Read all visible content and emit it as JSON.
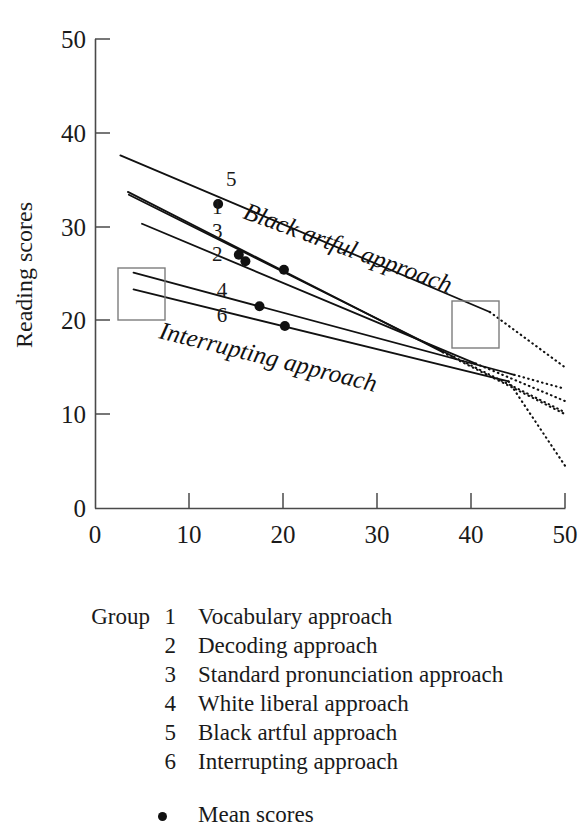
{
  "chart_data": {
    "type": "line",
    "title": "",
    "xlabel": "Black dialect scores",
    "ylabel": "Reading scores",
    "xlim": [
      0,
      50
    ],
    "ylim": [
      0,
      50
    ],
    "xticks": [
      0,
      10,
      20,
      30,
      40,
      50
    ],
    "yticks": [
      0,
      10,
      20,
      30,
      40,
      50
    ],
    "grid": false,
    "legend_position": "below-figure",
    "annotations": [
      {
        "name": "black-artful-approach-inline",
        "text": "Black artful approach",
        "rotation": 20
      },
      {
        "name": "interrupting-approach-inline",
        "text": "Interrupting approach",
        "rotation": 14
      }
    ],
    "series": [
      {
        "name": "Group 1 Vocabulary approach",
        "label": "1",
        "label_x": 13.0,
        "label_y": 31.3,
        "solid": {
          "x1": 3.5,
          "y1": 33.7,
          "x2": 37.0,
          "y2": 16.6
        },
        "dotted": {
          "x1": 37.0,
          "y1": 16.6,
          "x2": 50.0,
          "y2": 10.0
        },
        "mean_point": {
          "x": 15.3,
          "y": 27.0
        }
      },
      {
        "name": "Group 2 Decoding approach",
        "label": "2",
        "label_x": 13.0,
        "label_y": 26.3,
        "solid": {
          "x1": 5.0,
          "y1": 30.3,
          "x2": 40.5,
          "y2": 15.4
        },
        "dotted": {
          "x1": 40.5,
          "y1": 15.4,
          "x2": 50.0,
          "y2": 11.4
        },
        "mean_point": {
          "x": 20.1,
          "y": 25.4
        }
      },
      {
        "name": "Group 3 Standard pronunciation approach",
        "label": "3",
        "label_x": 13.0,
        "label_y": 28.8,
        "solid": {
          "x1": 3.6,
          "y1": 33.4,
          "x2": 38.2,
          "y2": 16.1
        },
        "dotted": {
          "x1": 38.2,
          "y1": 16.1,
          "x2": 50.0,
          "y2": 10.2
        },
        "mean_point": {
          "x": 16.0,
          "y": 26.3
        }
      },
      {
        "name": "Group 4 White liberal approach",
        "label": "4",
        "label_x": 13.5,
        "label_y": 22.5,
        "solid": {
          "x1": 4.1,
          "y1": 25.1,
          "x2": 44.6,
          "y2": 14.2
        },
        "dotted": {
          "x1": 44.6,
          "y1": 14.2,
          "x2": 50.0,
          "y2": 12.7
        },
        "mean_point": {
          "x": 17.5,
          "y": 21.5
        }
      },
      {
        "name": "Group 5 Black artful approach",
        "label": "5",
        "label_x": 14.5,
        "label_y": 34.3,
        "solid": {
          "x1": 2.7,
          "y1": 37.6,
          "x2": 42.0,
          "y2": 20.9
        },
        "dotted": {
          "x1": 42.0,
          "y1": 20.9,
          "x2": 50.0,
          "y2": 15.0
        },
        "mean_point": {
          "x": 13.1,
          "y": 32.4
        }
      },
      {
        "name": "Group 6 Interrupting approach",
        "label": "6",
        "label_x": 13.5,
        "label_y": 19.8,
        "solid": {
          "x1": 4.1,
          "y1": 23.3,
          "x2": 44.0,
          "y2": 13.5
        },
        "dotted": {
          "x1": 44.0,
          "y1": 13.5,
          "x2": 50.0,
          "y2": 4.5
        },
        "mean_point": {
          "x": 20.2,
          "y": 19.4
        }
      }
    ]
  },
  "axes": {
    "y_title": "Reading scores",
    "x_title": "Black dialect scores",
    "x_tick_labels": [
      "0",
      "10",
      "20",
      "30",
      "40",
      "50"
    ],
    "y_tick_labels": [
      "0",
      "10",
      "20",
      "30",
      "40",
      "50"
    ]
  },
  "inline_labels": {
    "black_artful": "Black artful approach",
    "interrupting": "Interrupting approach"
  },
  "series_numbers": [
    "1",
    "2",
    "3",
    "4",
    "5",
    "6"
  ],
  "legend": {
    "group_word": "Group",
    "items": [
      {
        "num": "1",
        "text": "Vocabulary approach"
      },
      {
        "num": "2",
        "text": "Decoding approach"
      },
      {
        "num": "3",
        "text": "Standard pronunciation approach"
      },
      {
        "num": "4",
        "text": "White liberal approach"
      },
      {
        "num": "5",
        "text": "Black artful approach"
      },
      {
        "num": "6",
        "text": "Interrupting approach"
      }
    ],
    "mean_label": "Mean scores"
  },
  "colors": {
    "line": "#111111",
    "axis": "#4a4a4a",
    "callout_box": "#7d7d7d",
    "text": "#1a1a1a",
    "background": "#ffffff"
  }
}
